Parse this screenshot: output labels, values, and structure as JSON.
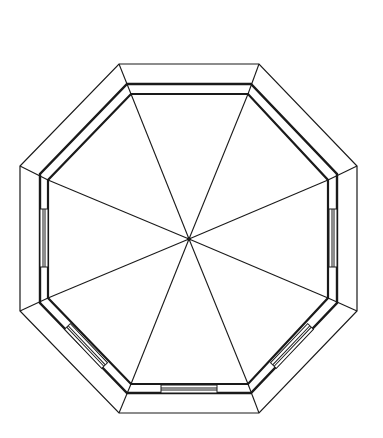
{
  "diagram": {
    "title": "Octagonal gazebo plan",
    "colors": {
      "background": "#ffffff",
      "stroke": "#1a1a1a"
    },
    "center": [
      189,
      239
    ],
    "outer_octagon": [
      [
        119,
        64
      ],
      [
        259,
        64
      ],
      [
        357,
        166
      ],
      [
        357,
        311
      ],
      [
        259,
        413
      ],
      [
        119,
        413
      ],
      [
        20,
        311
      ],
      [
        20,
        166
      ]
    ],
    "wall_outer": [
      [
        127,
        84
      ],
      [
        251,
        84
      ],
      [
        337,
        174
      ],
      [
        337,
        303
      ],
      [
        251,
        393
      ],
      [
        127,
        393
      ],
      [
        40,
        303
      ],
      [
        40,
        174
      ]
    ],
    "wall_inner": [
      [
        131,
        94
      ],
      [
        248,
        94
      ],
      [
        328,
        180
      ],
      [
        328,
        298
      ],
      [
        248,
        384
      ],
      [
        131,
        384
      ],
      [
        48,
        298
      ],
      [
        48,
        180
      ]
    ],
    "windows": [
      {
        "side": "left",
        "label": "window-left"
      },
      {
        "side": "right",
        "label": "window-right"
      },
      {
        "side": "bottom",
        "label": "window-bottom"
      },
      {
        "side": "bottom-left",
        "label": "window-bottom-left"
      },
      {
        "side": "bottom-right",
        "label": "window-bottom-right"
      }
    ]
  }
}
